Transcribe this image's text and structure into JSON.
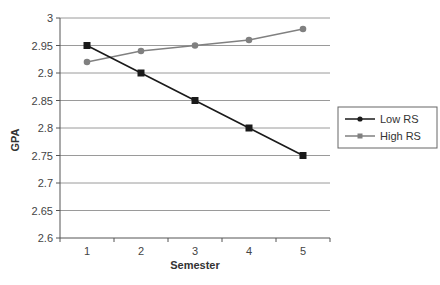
{
  "chart_data": {
    "type": "line",
    "title": "",
    "xlabel": "Semester",
    "ylabel": "GPA",
    "categories": [
      "1",
      "2",
      "3",
      "4",
      "5"
    ],
    "series": [
      {
        "name": "Low RS",
        "values": [
          2.95,
          2.9,
          2.85,
          2.8,
          2.75
        ],
        "color": "#1a1a1a",
        "marker": "square"
      },
      {
        "name": "High RS",
        "values": [
          2.92,
          2.94,
          2.95,
          2.96,
          2.98
        ],
        "color": "#808080",
        "marker": "circle"
      }
    ],
    "ylim": [
      2.6,
      3.0
    ],
    "yticks": [
      "2.6",
      "2.65",
      "2.7",
      "2.75",
      "2.8",
      "2.85",
      "2.9",
      "2.95",
      "3"
    ],
    "grid": true,
    "legend_position": "right",
    "legend": [
      {
        "label": "Low RS",
        "marker": "circle",
        "color": "#1a1a1a"
      },
      {
        "label": "High RS",
        "marker": "square",
        "color": "#808080"
      }
    ]
  }
}
